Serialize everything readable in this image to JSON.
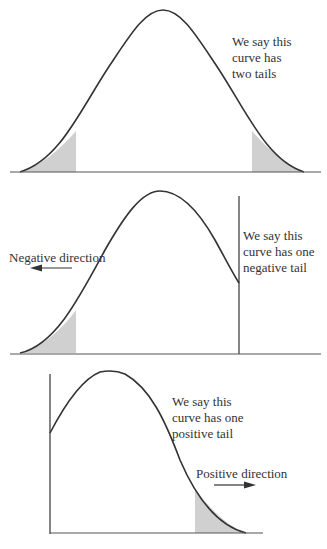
{
  "panels": [
    {
      "id": "two-tails",
      "annotation": "We say this\ncurve has\ntwo tails",
      "shaded_regions": [
        "left tail",
        "right tail"
      ]
    },
    {
      "id": "negative-tail",
      "annotation": "We say this\ncurve has one\nnegative tail",
      "direction_label": "Negative direction",
      "direction_arrow": "left",
      "shaded_regions": [
        "left tail"
      ]
    },
    {
      "id": "positive-tail",
      "annotation": "We say this\ncurve has one\npositive tail",
      "direction_label": "Positive direction",
      "direction_arrow": "right",
      "shaded_regions": [
        "right tail"
      ]
    }
  ],
  "colors": {
    "line": "#333333",
    "shade": "#d0d0d0",
    "axis": "#555555"
  }
}
